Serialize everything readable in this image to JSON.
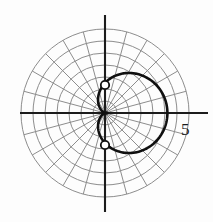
{
  "figure": {
    "kind": "polar-plot",
    "background": "#fdfdfd",
    "origin": {
      "x": 105,
      "y": 113
    },
    "unit_px": 12,
    "colors": {
      "grid": "#8d8d8d",
      "axis": "#1c1c1c",
      "curve": "#101010",
      "marker_fill": "#ffffff",
      "marker_stroke": "#101010",
      "text": "#1a1a1a"
    },
    "grid": {
      "circle_radii_units": [
        1,
        2,
        3,
        4,
        5,
        6,
        7
      ],
      "spoke_angles_deg": [
        0,
        15,
        30,
        45,
        60,
        75,
        90,
        105,
        120,
        135,
        150,
        165,
        180,
        195,
        210,
        225,
        240,
        255,
        270,
        285,
        300,
        315,
        330,
        345
      ],
      "spoke_length_units": 7,
      "show_grid": true
    },
    "axes": {
      "x_axis": {
        "from_px": 20,
        "to_px": 208,
        "y_px": 113
      },
      "y_axis": {
        "from_px": 15,
        "to_px": 212,
        "x_px": 105
      }
    },
    "labels": {
      "x_tick": "5",
      "x_tick_pos": {
        "x": 181,
        "y": 121
      },
      "top_cut_mark": "I",
      "top_cut_mark_pos": {
        "x": 31,
        "y": -9
      }
    },
    "markers": [
      {
        "name": "marker-upper",
        "x_px": 105,
        "y_px": 85,
        "r_px": 4.2,
        "theta_deg": 90,
        "r_units": 2.3
      },
      {
        "name": "marker-lower",
        "x_px": 105,
        "y_px": 145,
        "r_px": 4.2,
        "theta_deg": -90,
        "r_units": 2.7
      }
    ]
  },
  "chart_data": {
    "type": "line",
    "coordinate_system": "polar",
    "title": "",
    "xlabel": "",
    "ylabel": "",
    "equation": "r = 2.5 + 2.7 cos(theta)",
    "grid": true,
    "legend": "none",
    "r_axis_ticks": [
      1,
      2,
      3,
      4,
      5,
      6,
      7
    ],
    "r_labeled_tick": 5,
    "theta_ticks_deg": [
      0,
      15,
      30,
      45,
      60,
      75,
      90,
      105,
      120,
      135,
      150,
      165,
      180,
      195,
      210,
      225,
      240,
      255,
      270,
      285,
      300,
      315,
      330,
      345
    ],
    "rlim": [
      0,
      7
    ],
    "series": [
      {
        "name": "limacon",
        "theta_deg": [
          0,
          15,
          30,
          45,
          60,
          75,
          90,
          105,
          120,
          135,
          150,
          165,
          180,
          195,
          210,
          225,
          240,
          255,
          270,
          285,
          300,
          315,
          330,
          345,
          360
        ],
        "r": [
          5.2,
          5.11,
          4.84,
          4.41,
          3.85,
          3.2,
          2.5,
          1.8,
          1.15,
          0.59,
          0.16,
          -0.11,
          -0.2,
          -0.11,
          0.16,
          0.59,
          1.15,
          1.8,
          2.5,
          3.2,
          3.85,
          4.41,
          4.84,
          5.11,
          5.2
        ]
      }
    ],
    "annotations": [
      {
        "text": "5",
        "theta_deg": 0,
        "r": 5.9
      }
    ]
  }
}
